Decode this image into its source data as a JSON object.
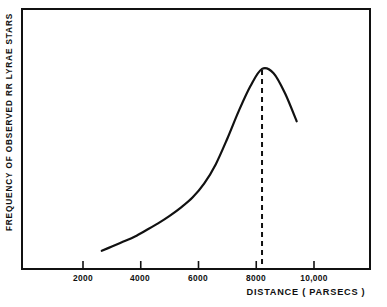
{
  "figure": {
    "background_color": "#ffffff",
    "ink_color": "#111111"
  },
  "chart_data": {
    "type": "line",
    "title": "",
    "subtitle": "",
    "xlabel": "DISTANCE ( PARSECS )",
    "ylabel": "FREQUENCY OF OBSERVED RR LYRAE STARS",
    "xlim": [
      0,
      12000
    ],
    "ylim": [
      0,
      1.0
    ],
    "grid": false,
    "legend": null,
    "xtick_labels": [
      "2000",
      "4000",
      "6000",
      "8000",
      "10,000"
    ],
    "xtick_values": [
      2000,
      4000,
      6000,
      8000,
      10000
    ],
    "ytick_labels": [],
    "ytick_values": [],
    "series": [
      {
        "name": "Frequency of observed RR Lyrae stars",
        "x": [
          2650,
          3000,
          3400,
          3800,
          4200,
          4600,
          5000,
          5400,
          5800,
          6200,
          6600,
          7000,
          7400,
          7800,
          8200,
          8600,
          9000,
          9400
        ],
        "y": [
          0.085,
          0.105,
          0.128,
          0.152,
          0.182,
          0.213,
          0.248,
          0.288,
          0.335,
          0.4,
          0.49,
          0.61,
          0.74,
          0.855,
          0.935,
          0.915,
          0.82,
          0.69
        ],
        "style": "solid",
        "color": "#111111",
        "width": 2.2
      }
    ],
    "annotations": [
      {
        "name": "peak-marker",
        "type": "vertical-dashed-line",
        "x": 8200,
        "label": "",
        "color": "#111111",
        "dash": "5,4"
      }
    ]
  },
  "axis": {
    "x_tick_marks": 5,
    "frame": "box"
  }
}
